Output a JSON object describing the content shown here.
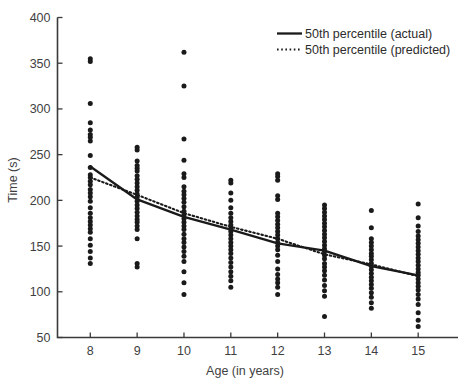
{
  "chart_data": {
    "type": "scatter",
    "title": "",
    "xlabel": "Age (in years)",
    "ylabel": "Time (s)",
    "xlim": [
      7.3,
      15.85
    ],
    "ylim": [
      50,
      400
    ],
    "xticks": [
      8,
      9,
      10,
      11,
      12,
      13,
      14,
      15
    ],
    "xtick_labels": [
      "8",
      "9",
      "10",
      "11",
      "12",
      "13",
      "14",
      "15"
    ],
    "yticks": [
      50,
      100,
      150,
      200,
      250,
      300,
      350,
      400
    ],
    "ytick_labels": [
      "50",
      "100",
      "150",
      "200",
      "250",
      "300",
      "350",
      "400"
    ],
    "grid": false,
    "legend_position": "top-right",
    "legend": [
      {
        "label": "50th percentile (actual)",
        "style": "solid",
        "color": "#1a1a1a"
      },
      {
        "label": "50th percentile (predicted)",
        "style": "dotted",
        "color": "#1a1a1a"
      }
    ],
    "series": [
      {
        "name": "50th percentile (actual)",
        "type": "line",
        "style": "solid",
        "x": [
          8,
          9,
          10,
          11,
          12,
          13,
          14,
          15
        ],
        "values": [
          237,
          201,
          182,
          168,
          153,
          145,
          128,
          118
        ]
      },
      {
        "name": "50th percentile (predicted)",
        "type": "line",
        "style": "dotted",
        "x": [
          8,
          9,
          10,
          11,
          12,
          13,
          14,
          15
        ],
        "values": [
          225,
          206,
          186,
          171,
          158,
          141,
          130,
          117
        ]
      }
    ],
    "scatter_points": [
      {
        "age": 8,
        "times": [
          355,
          352,
          306,
          285,
          277,
          272,
          269,
          265,
          249,
          236,
          228,
          225,
          221,
          217,
          212,
          208,
          204,
          199,
          192,
          186,
          181,
          177,
          173,
          169,
          165,
          158,
          151,
          144,
          137,
          131
        ]
      },
      {
        "age": 9,
        "times": [
          258,
          255,
          243,
          238,
          235,
          232,
          227,
          223,
          219,
          215,
          211,
          207,
          203,
          199,
          195,
          191,
          187,
          183,
          179,
          176,
          172,
          168,
          158,
          131,
          127
        ]
      },
      {
        "age": 10,
        "times": [
          362,
          325,
          267,
          244,
          229,
          225,
          215,
          210,
          206,
          202,
          198,
          193,
          188,
          184,
          180,
          176,
          172,
          168,
          163,
          158,
          154,
          149,
          144,
          139,
          133,
          122,
          110,
          97
        ]
      },
      {
        "age": 11,
        "times": [
          222,
          219,
          208,
          200,
          192,
          186,
          181,
          177,
          173,
          169,
          166,
          162,
          158,
          154,
          150,
          146,
          142,
          137,
          132,
          127,
          122,
          117,
          112,
          105
        ]
      },
      {
        "age": 12,
        "times": [
          229,
          226,
          222,
          205,
          201,
          186,
          182,
          178,
          174,
          170,
          166,
          162,
          158,
          154,
          150,
          146,
          140,
          133,
          125,
          119,
          114,
          110,
          105,
          97
        ]
      },
      {
        "age": 13,
        "times": [
          195,
          191,
          187,
          183,
          179,
          175,
          171,
          167,
          163,
          159,
          155,
          151,
          147,
          144,
          140,
          136,
          131,
          127,
          123,
          118,
          113,
          107,
          101,
          95,
          73
        ]
      },
      {
        "age": 14,
        "times": [
          189,
          170,
          158,
          154,
          150,
          146,
          142,
          139,
          135,
          131,
          128,
          124,
          120,
          116,
          112,
          108,
          104,
          99,
          94,
          88,
          82
        ]
      },
      {
        "age": 15,
        "times": [
          196,
          181,
          172,
          166,
          161,
          157,
          153,
          149,
          145,
          141,
          137,
          133,
          129,
          125,
          121,
          118,
          114,
          110,
          106,
          102,
          97,
          92,
          86,
          77,
          69,
          62
        ]
      }
    ]
  }
}
